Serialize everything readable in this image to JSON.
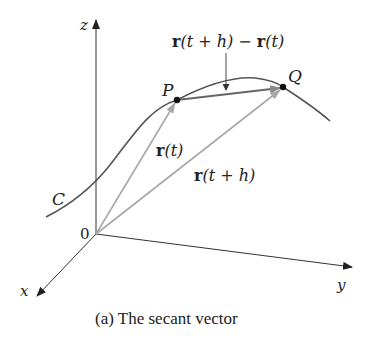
{
  "figure": {
    "caption": "(a) The secant vector",
    "axes": {
      "x_label": "x",
      "y_label": "y",
      "z_label": "z",
      "origin_label": "0"
    },
    "curve_label": "C",
    "points": {
      "P": "P",
      "Q": "Q"
    },
    "vectors": {
      "r_t": {
        "bold": "r",
        "arg": "(t)"
      },
      "r_t_plus_h": {
        "bold": "r",
        "arg": "(t + h)"
      },
      "secant": {
        "bold1": "r",
        "arg1": "(t + h) − ",
        "bold2": "r",
        "arg2": "(t)"
      }
    },
    "colors": {
      "axis": "#333333",
      "curve": "#555555",
      "position_vector": "#a8a8a8",
      "secant_vector": "#666666",
      "point": "#111111"
    }
  }
}
